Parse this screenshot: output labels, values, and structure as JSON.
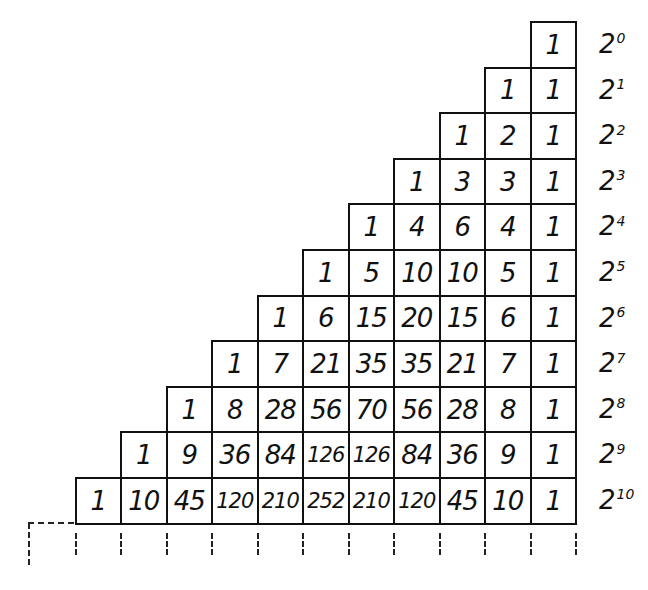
{
  "diagram": {
    "title": "",
    "type": "pascal-triangle-powers-of-two",
    "rows": [
      {
        "power_label": "2",
        "exponent": "0",
        "values": [
          "1"
        ]
      },
      {
        "power_label": "2",
        "exponent": "1",
        "values": [
          "1",
          "1"
        ]
      },
      {
        "power_label": "2",
        "exponent": "2",
        "values": [
          "1",
          "2",
          "1"
        ]
      },
      {
        "power_label": "2",
        "exponent": "3",
        "values": [
          "1",
          "3",
          "3",
          "1"
        ]
      },
      {
        "power_label": "2",
        "exponent": "4",
        "values": [
          "1",
          "4",
          "6",
          "4",
          "1"
        ]
      },
      {
        "power_label": "2",
        "exponent": "5",
        "values": [
          "1",
          "5",
          "10",
          "10",
          "5",
          "1"
        ]
      },
      {
        "power_label": "2",
        "exponent": "6",
        "values": [
          "1",
          "6",
          "15",
          "20",
          "15",
          "6",
          "1"
        ]
      },
      {
        "power_label": "2",
        "exponent": "7",
        "values": [
          "1",
          "7",
          "21",
          "35",
          "35",
          "21",
          "7",
          "1"
        ]
      },
      {
        "power_label": "2",
        "exponent": "8",
        "values": [
          "1",
          "8",
          "28",
          "56",
          "70",
          "56",
          "28",
          "8",
          "1"
        ]
      },
      {
        "power_label": "2",
        "exponent": "9",
        "values": [
          "1",
          "9",
          "36",
          "84",
          "126",
          "126",
          "84",
          "36",
          "9",
          "1"
        ]
      },
      {
        "power_label": "2",
        "exponent": "10",
        "values": [
          "1",
          "10",
          "45",
          "120",
          "210",
          "252",
          "210",
          "120",
          "45",
          "10",
          "1"
        ]
      }
    ],
    "continuation": "dashed lines below bottom row indicating the triangle continues"
  }
}
